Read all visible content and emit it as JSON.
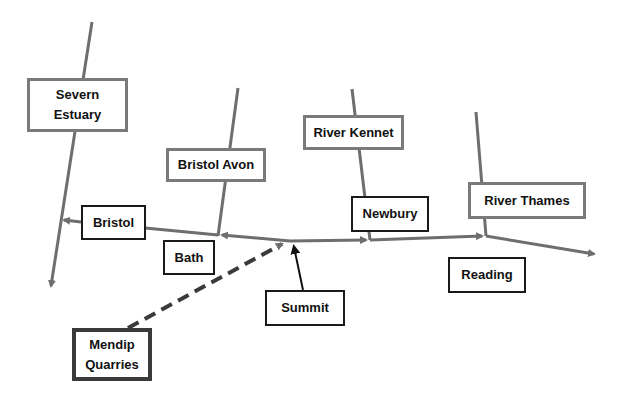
{
  "diagram": {
    "title": "",
    "colors": {
      "river_line": "#6e6e6e",
      "canal_line": "#6e6e6e",
      "summit_arrow": "#111111",
      "mendip_dashed": "#3a3a3a",
      "river_box_border": "#7a7a7a",
      "town_box_border": "#1a1a1a"
    },
    "rivers": [
      {
        "id": "severn",
        "label": "Severn\nEstuary"
      },
      {
        "id": "bristol_avon",
        "label": "Bristol Avon"
      },
      {
        "id": "kennet",
        "label": "River Kennet"
      },
      {
        "id": "thames",
        "label": "River  Thames"
      }
    ],
    "places": [
      {
        "id": "bristol",
        "label": "Bristol"
      },
      {
        "id": "bath",
        "label": "Bath"
      },
      {
        "id": "summit",
        "label": "Summit"
      },
      {
        "id": "newbury",
        "label": "Newbury"
      },
      {
        "id": "reading",
        "label": "Reading"
      },
      {
        "id": "mendip",
        "label": "Mendip\nQuarries"
      }
    ]
  }
}
